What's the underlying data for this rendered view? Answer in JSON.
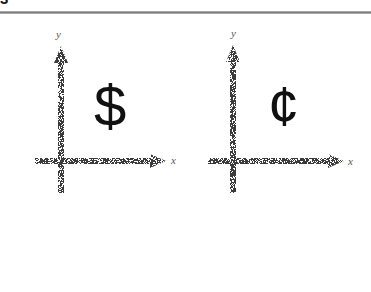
{
  "header": {
    "corner_mark": "3",
    "rule_color": "#8a8a8a"
  },
  "diagrams": [
    {
      "id": "dollar",
      "symbol": "$",
      "x_label": "x",
      "y_label": "y"
    },
    {
      "id": "cent",
      "symbol": "¢",
      "x_label": "x",
      "y_label": "y"
    }
  ],
  "colors": {
    "axis": "#3a3a3a",
    "symbol": "#111111",
    "background": "#ffffff"
  }
}
